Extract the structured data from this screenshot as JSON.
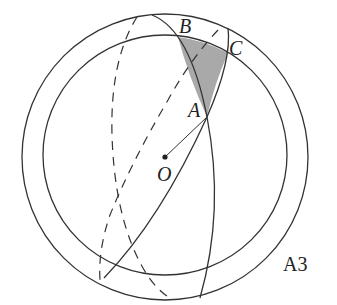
{
  "diagram": {
    "figure_tag": "A3",
    "points": {
      "A": "A",
      "B": "B",
      "C": "C",
      "O": "O"
    },
    "colors": {
      "stroke": "#333333",
      "shade": "#a9a9a9",
      "background": "#ffffff"
    },
    "elements": [
      "outer circle (sphere outline)",
      "inner circle (great circle, front)",
      "great circle through B and A (solid front, dashed back)",
      "great circle through C and A (solid front, dashed back)",
      "radius OA",
      "shaded spherical triangle ABC"
    ]
  }
}
